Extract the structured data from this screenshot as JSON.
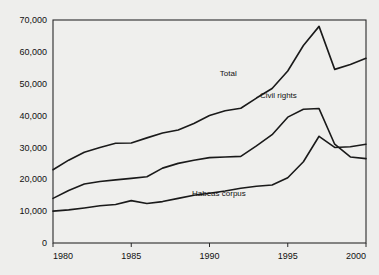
{
  "chart_data": {
    "type": "line",
    "title": "",
    "xlabel": "",
    "ylabel": "",
    "xlim": [
      1980,
      2000
    ],
    "ylim": [
      0,
      70000
    ],
    "grid": true,
    "legend_position": "inline-annotations",
    "xticks": [
      "1980",
      "1985",
      "1990",
      "1995",
      "2000"
    ],
    "yticks": [
      "0",
      "10,000",
      "20,000",
      "30,000",
      "40,000",
      "50,000",
      "60,000",
      "70,000"
    ],
    "x": [
      1980,
      1981,
      1982,
      1983,
      1984,
      1985,
      1986,
      1987,
      1988,
      1989,
      1990,
      1991,
      1992,
      1993,
      1994,
      1995,
      1996,
      1997,
      1998,
      1999,
      2000
    ],
    "series": [
      {
        "name": "Total",
        "label": "Total",
        "values": [
          23000,
          26000,
          28500,
          30000,
          31300,
          31400,
          33000,
          34500,
          35500,
          37500,
          40000,
          41500,
          42300,
          45500,
          48500,
          54000,
          62000,
          68000,
          54500,
          56000,
          58000
        ]
      },
      {
        "name": "Civil rights",
        "label": "Civil rights",
        "values": [
          14000,
          16500,
          18500,
          19300,
          19800,
          20300,
          20800,
          23500,
          25000,
          26000,
          26800,
          27000,
          27200,
          30500,
          34000,
          39500,
          42000,
          42200,
          31000,
          27000,
          26500
        ]
      },
      {
        "name": "Habeas corpus",
        "label": "Habeas corpus",
        "values": [
          10000,
          10400,
          11000,
          11700,
          12100,
          13300,
          12400,
          13000,
          14000,
          15000,
          15600,
          16300,
          17200,
          17800,
          18200,
          20500,
          25500,
          33500,
          30000,
          30200,
          31000
        ]
      }
    ],
    "annotations": [
      {
        "text": "Total",
        "x": 1991.2,
        "y": 52500
      },
      {
        "text": "Civil rights",
        "x": 1994.4,
        "y": 45500
      },
      {
        "text": "Habeas corpus",
        "x": 1990.6,
        "y": 14600
      }
    ],
    "colors": {
      "background": "#eeeeec",
      "plot_background": "#efefed",
      "line": "#1a1a1a",
      "grid": "#9a9a98",
      "frame": "#2a2a2a",
      "text": "#111111"
    }
  }
}
